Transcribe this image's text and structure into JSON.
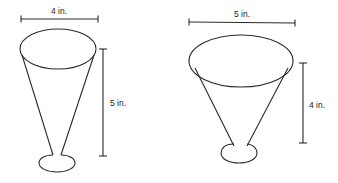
{
  "figures": [
    {
      "name": "cone-cup-a",
      "width_label": "4 in.",
      "height_label": "5 in.",
      "diameter_in": 4,
      "height_in": 5
    },
    {
      "name": "cone-cup-b",
      "width_label": "5 in.",
      "height_label": "4 in.",
      "diameter_in": 5,
      "height_in": 4
    }
  ],
  "colors": {
    "line": "#2a2a2a",
    "background": "#ffffff"
  }
}
